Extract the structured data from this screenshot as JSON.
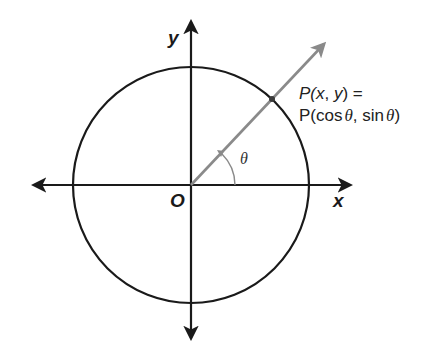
{
  "diagram": {
    "axes": {
      "x_label": "x",
      "y_label": "y",
      "origin_label": "O"
    },
    "angle": {
      "label": "θ"
    },
    "point": {
      "line1_prefix": "P(",
      "line1_x": "x",
      "line1_sep": ", ",
      "line1_y": "y",
      "line1_suffix": ") =",
      "line2_prefix": "P(cos",
      "line2_theta1": "θ",
      "line2_mid": ", sin",
      "line2_theta2": "θ",
      "line2_suffix": ")"
    },
    "colors": {
      "axes": "#1a1a1a",
      "circle": "#1a1a1a",
      "ray": "#8a8a8a",
      "background": "#ffffff"
    }
  }
}
